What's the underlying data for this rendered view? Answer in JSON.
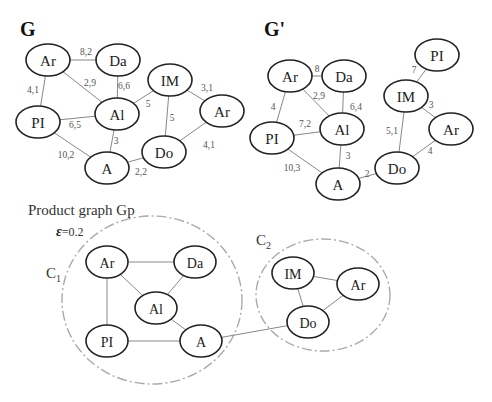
{
  "graph_g": {
    "title": "G",
    "nodes": [
      {
        "id": "Ar",
        "label": "Ar",
        "x": 48,
        "y": 60
      },
      {
        "id": "Da",
        "label": "Da",
        "x": 118,
        "y": 60
      },
      {
        "id": "IM",
        "label": "IM",
        "x": 170,
        "y": 80
      },
      {
        "id": "Ar2",
        "label": "Ar",
        "x": 222,
        "y": 111
      },
      {
        "id": "PI",
        "label": "PI",
        "x": 38,
        "y": 122
      },
      {
        "id": "Al",
        "label": "Al",
        "x": 117,
        "y": 114
      },
      {
        "id": "A",
        "label": "A",
        "x": 107,
        "y": 168
      },
      {
        "id": "Do",
        "label": "Do",
        "x": 164,
        "y": 152
      }
    ],
    "edges": [
      {
        "from": "Ar",
        "to": "Da",
        "weight": "8,2",
        "lx": 86,
        "ly": 52
      },
      {
        "from": "Ar",
        "to": "Al",
        "weight": "2,9",
        "lx": 90,
        "ly": 83
      },
      {
        "from": "Da",
        "to": "Al",
        "weight": "6,6",
        "lx": 124,
        "ly": 86
      },
      {
        "from": "Ar",
        "to": "PI",
        "weight": "4,1",
        "lx": 33,
        "ly": 90
      },
      {
        "from": "PI",
        "to": "Al",
        "weight": "6,5",
        "lx": 75,
        "ly": 125
      },
      {
        "from": "IM",
        "to": "Al",
        "weight": "5",
        "lx": 148,
        "ly": 104
      },
      {
        "from": "IM",
        "to": "Ar2",
        "weight": "3,1",
        "lx": 207,
        "ly": 88
      },
      {
        "from": "IM",
        "to": "Do",
        "weight": "5",
        "lx": 172,
        "ly": 118
      },
      {
        "from": "Al",
        "to": "A",
        "weight": "3",
        "lx": 116,
        "ly": 141
      },
      {
        "from": "PI",
        "to": "A",
        "weight": "10,2",
        "lx": 66,
        "ly": 155
      },
      {
        "from": "A",
        "to": "Do",
        "weight": "2,2",
        "lx": 141,
        "ly": 172
      },
      {
        "from": "Ar2",
        "to": "Do",
        "weight": "4,1",
        "lx": 209,
        "ly": 145
      }
    ]
  },
  "graph_g_prime": {
    "title": "G'",
    "nodes": [
      {
        "id": "PI2",
        "label": "PI",
        "x": 437,
        "y": 55
      },
      {
        "id": "Ar",
        "label": "Ar",
        "x": 290,
        "y": 76
      },
      {
        "id": "Da",
        "label": "Da",
        "x": 344,
        "y": 76
      },
      {
        "id": "IM",
        "label": "IM",
        "x": 406,
        "y": 96
      },
      {
        "id": "Al",
        "label": "Al",
        "x": 342,
        "y": 129
      },
      {
        "id": "Ar2",
        "label": "Ar",
        "x": 451,
        "y": 129
      },
      {
        "id": "PI",
        "label": "PI",
        "x": 272,
        "y": 138
      },
      {
        "id": "Do",
        "label": "Do",
        "x": 397,
        "y": 168
      },
      {
        "id": "A",
        "label": "A",
        "x": 338,
        "y": 184
      }
    ],
    "edges": [
      {
        "from": "Ar",
        "to": "Da",
        "weight": "8",
        "lx": 317,
        "ly": 69
      },
      {
        "from": "Ar",
        "to": "Al",
        "weight": "2,9",
        "lx": 319,
        "ly": 96
      },
      {
        "from": "Da",
        "to": "Al",
        "weight": "6,4",
        "lx": 356,
        "ly": 107
      },
      {
        "from": "Ar",
        "to": "PI",
        "weight": "4",
        "lx": 273,
        "ly": 107
      },
      {
        "from": "PI",
        "to": "Al",
        "weight": "7,2",
        "lx": 305,
        "ly": 124
      },
      {
        "from": "PI",
        "to": "A",
        "weight": "10,3",
        "lx": 292,
        "ly": 168
      },
      {
        "from": "Al",
        "to": "A",
        "weight": "3",
        "lx": 348,
        "ly": 156
      },
      {
        "from": "A",
        "to": "Do",
        "weight": "2",
        "lx": 367,
        "ly": 174
      },
      {
        "from": "PI2",
        "to": "IM",
        "weight": "7",
        "lx": 414,
        "ly": 70
      },
      {
        "from": "IM",
        "to": "Ar2",
        "weight": "3",
        "lx": 431,
        "ly": 105
      },
      {
        "from": "IM",
        "to": "Do",
        "weight": "5,1",
        "lx": 392,
        "ly": 131
      },
      {
        "from": "Ar2",
        "to": "Do",
        "weight": "4",
        "lx": 430,
        "ly": 151
      }
    ]
  },
  "product_graph": {
    "caption": "Product graph Gp",
    "epsilon_symbol": "ε",
    "epsilon_value": "=0.2",
    "clusters": [
      {
        "label": "C",
        "sub": "1",
        "cx": 152,
        "cy": 300,
        "rx": 90,
        "ry": 84,
        "lx": 46,
        "ly": 278
      },
      {
        "label": "C",
        "sub": "2",
        "cx": 323,
        "cy": 295,
        "rx": 67,
        "ry": 56,
        "lx": 256,
        "ly": 245
      }
    ],
    "nodes": [
      {
        "id": "Ar",
        "label": "Ar",
        "x": 107,
        "y": 262
      },
      {
        "id": "Da",
        "label": "Da",
        "x": 195,
        "y": 262
      },
      {
        "id": "Al",
        "label": "Al",
        "x": 156,
        "y": 308
      },
      {
        "id": "PI",
        "label": "PI",
        "x": 107,
        "y": 341
      },
      {
        "id": "A",
        "label": "A",
        "x": 201,
        "y": 341
      },
      {
        "id": "IM",
        "label": "IM",
        "x": 293,
        "y": 273
      },
      {
        "id": "Ar2",
        "label": "Ar",
        "x": 358,
        "y": 284
      },
      {
        "id": "Do",
        "label": "Do",
        "x": 308,
        "y": 322
      }
    ],
    "edges": [
      {
        "from": "Ar",
        "to": "Da"
      },
      {
        "from": "Ar",
        "to": "Al"
      },
      {
        "from": "Da",
        "to": "Al"
      },
      {
        "from": "Ar",
        "to": "PI"
      },
      {
        "from": "Al",
        "to": "A"
      },
      {
        "from": "PI",
        "to": "A"
      },
      {
        "from": "A",
        "to": "Do"
      },
      {
        "from": "IM",
        "to": "Ar2"
      },
      {
        "from": "IM",
        "to": "Do"
      },
      {
        "from": "Ar2",
        "to": "Do"
      }
    ]
  }
}
